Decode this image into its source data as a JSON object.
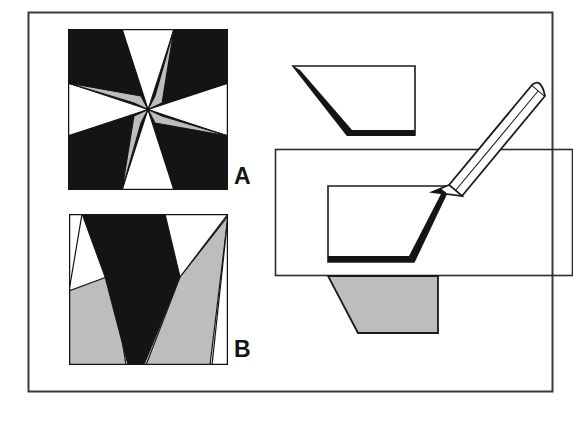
{
  "figure": {
    "width": 573,
    "height": 423,
    "background_color": "#ffffff",
    "border_color": "#2b2b2b",
    "frame": {
      "x": 28,
      "y": 12,
      "width": 525,
      "height": 380
    }
  },
  "palette": {
    "black": "#141414",
    "gray": "#bdbdbd",
    "white": "#ffffff",
    "outline": "#1a1a1a",
    "frame": "#3a3a3a"
  },
  "labels": {
    "pattern_a": "A",
    "pattern_b": "B"
  },
  "panels": [
    {
      "name": "pattern-a",
      "label": "A",
      "type": "eight-pointed-star-quilt-block",
      "x": 68,
      "y": 29,
      "size": 160,
      "description": "Eight pointed star block: black corner squares, gray side squares, alternating white and black star diamonds",
      "corner_squares_color": "#141414",
      "side_squares_color": "#bdbdbd",
      "star_points": [
        "white",
        "black",
        "white",
        "black",
        "white",
        "black",
        "white",
        "black"
      ]
    },
    {
      "name": "pattern-b",
      "label": "B",
      "type": "distorted-star-perspective",
      "x": 69,
      "y": 214,
      "width": 159,
      "height": 151,
      "description": "Perspective distorted block with large black wedge, gray wedges and white background regions",
      "wedge_colors": [
        "#141414",
        "#bdbdbd",
        "#ffffff"
      ]
    },
    {
      "name": "trapezoid-top",
      "type": "trapezoid-outline",
      "fill": "#ffffff",
      "thick_edge": "bottom-left",
      "x": 291,
      "y": 66,
      "width": 124,
      "height": 69
    },
    {
      "name": "trapezoid-middle-in-rectangle",
      "type": "trapezoid-outline",
      "fill": "#ffffff",
      "thick_edge": "bottom-right",
      "x": 326,
      "y": 186,
      "width": 124,
      "height": 76,
      "rectangle": {
        "x": 275,
        "y": 149,
        "width": 298,
        "height": 127
      }
    },
    {
      "name": "trapezoid-bottom",
      "type": "trapezoid-filled",
      "fill": "#bdbdbd",
      "x": 328,
      "y": 276,
      "width": 110,
      "height": 57
    }
  ],
  "pencil": {
    "name": "pencil",
    "description": "Outlined pencil pointing down-left toward the trapezoid corner",
    "tip_x": 432,
    "tip_y": 192,
    "end_x": 538,
    "end_y": 92,
    "body_fill": "#ffffff",
    "outline": "#1a1a1a"
  }
}
